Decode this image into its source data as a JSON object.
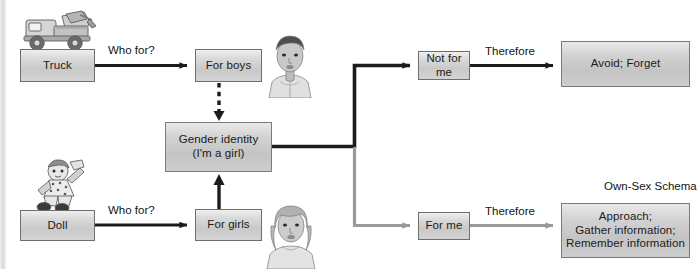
{
  "diagram": {
    "nodes": {
      "truck": {
        "label": "Truck"
      },
      "doll": {
        "label": "Doll"
      },
      "for_boys": {
        "label": "For boys"
      },
      "for_girls": {
        "label": "For girls"
      },
      "gender_identity": {
        "line1": "Gender identity",
        "line2": "(I'm a girl)"
      },
      "not_for_me": {
        "label": "Not for me"
      },
      "for_me": {
        "label": "For me"
      },
      "avoid_forget": {
        "label": "Avoid; Forget"
      },
      "own_sex_schema": {
        "caption": "Own-Sex Schema",
        "line1": "Approach;",
        "line2": "Gather information;",
        "line3": "Remember information"
      }
    },
    "edge_labels": {
      "who_for_top": "Who for?",
      "who_for_bottom": "Who for?",
      "therefore_top": "Therefore",
      "therefore_bottom": "Therefore"
    },
    "illustrations": {
      "truck_toy": "toy-dump-truck-illustration",
      "doll_toy": "rag-doll-illustration",
      "boy": "boy-portrait-illustration",
      "girl": "girl-portrait-illustration"
    },
    "colors": {
      "dark_arrow": "#1c1c1c",
      "light_arrow": "#9a9a9a",
      "box_border": "#6e6e6e",
      "box_fill_light": "#efefef",
      "box_fill_dark": "#c4c4c4",
      "text": "#1a1a1a",
      "page_edge": "#d8d8d8"
    }
  }
}
